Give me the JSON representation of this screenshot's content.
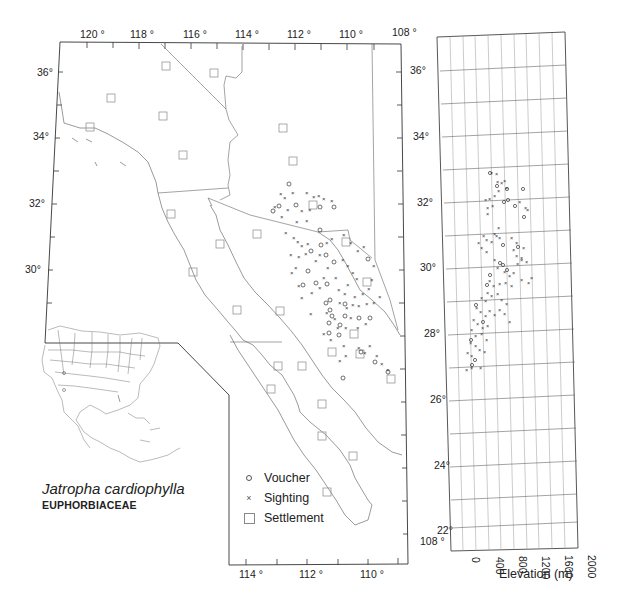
{
  "map": {
    "top_longitude_labels": [
      "120 °",
      "118 °",
      "116 °",
      "114 °",
      "112 °",
      "110 °",
      "108 °"
    ],
    "bottom_longitude_labels": [
      "114 °",
      "112 °",
      "110 °",
      "108 °"
    ],
    "left_latitude_labels": [
      "36°",
      "34°",
      "32°",
      "30°"
    ],
    "right_latitude_labels": [
      "36°",
      "34°",
      "32°",
      "30°",
      "28°",
      "26°",
      "24°",
      "22°"
    ]
  },
  "legend": {
    "items": [
      {
        "symbol": "voucher",
        "label": "Voucher"
      },
      {
        "symbol": "sighting",
        "label": "Sighting"
      },
      {
        "symbol": "settlement",
        "label": "Settlement"
      }
    ]
  },
  "taxon": {
    "species": "Jatropha cardiophylla",
    "family": "EUPHORBIACEAE"
  },
  "elevation_panel": {
    "x_tick_labels": [
      "0",
      "400",
      "800",
      "1200",
      "1600",
      "2000"
    ],
    "x_label": "Elevation (m)",
    "x_range_m": [
      0,
      2000
    ],
    "y_range_deg": [
      22,
      37
    ],
    "observed_range_m": [
      0,
      1000
    ],
    "observed_latitude_range_deg": [
      27,
      33
    ]
  }
}
